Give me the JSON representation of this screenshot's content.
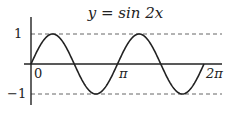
{
  "chart_data": {
    "type": "line",
    "title": "y = sin 2x",
    "xlabel": "",
    "ylabel": "",
    "x_ticks": [
      "0",
      "π",
      "2π"
    ],
    "y_ticks": [
      "1",
      "−1"
    ],
    "xlim": [
      0,
      6.2832
    ],
    "ylim": [
      -1,
      1
    ],
    "grid": false,
    "reference_lines": [
      {
        "y": 1,
        "style": "dashed"
      },
      {
        "y": -1,
        "style": "dashed"
      }
    ],
    "series": [
      {
        "name": "sin 2x",
        "x": [
          0,
          0.7854,
          1.5708,
          2.3562,
          3.1416,
          3.927,
          4.7124,
          5.4978,
          6.2832
        ],
        "values": [
          0,
          1,
          0,
          -1,
          0,
          1,
          0,
          -1,
          0
        ]
      }
    ]
  },
  "labels": {
    "title": "y = sin 2x",
    "x0": "0",
    "xpi": "π",
    "x2pi": "2π",
    "y1": "1",
    "ym1": "−1"
  }
}
